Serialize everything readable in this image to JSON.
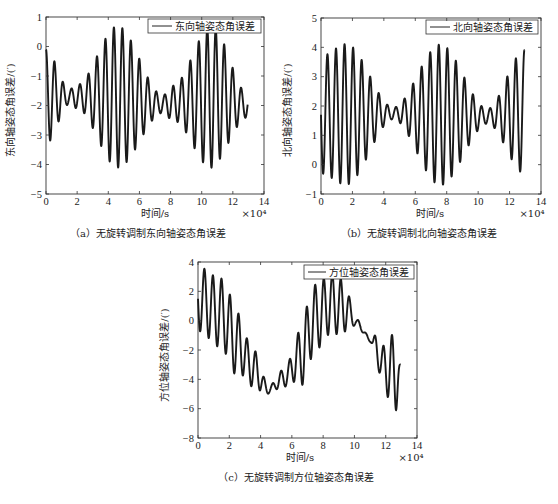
{
  "chart_data": [
    {
      "id": "a",
      "type": "line",
      "caption": "（a）无旋转调制东向轴姿态角误差",
      "xlabel": "时间/s",
      "xscale_label": "×10⁴",
      "ylabel": "东向轴姿态角误差/(′)",
      "legend": "东向轴姿态角误差",
      "xlim": [
        0,
        14
      ],
      "ylim": [
        -5,
        1
      ],
      "xticks": [
        0,
        2,
        4,
        6,
        8,
        10,
        12,
        14
      ],
      "yticks": [
        -5,
        -4,
        -3,
        -2,
        -1,
        0,
        1
      ],
      "grid": false,
      "frame": {
        "x0": 46,
        "y0": 17,
        "x1": 264,
        "y1": 194
      },
      "legend_box": {
        "x": 148,
        "y": 19,
        "w": 113,
        "h": 14
      },
      "signal": {
        "x_end": 12.95,
        "period": 0.545,
        "phase": 0.0,
        "center": [
          [
            0,
            -1.7
          ],
          [
            4.5,
            -1.7
          ],
          [
            7.5,
            -1.95
          ],
          [
            11,
            -1.7
          ],
          [
            12.95,
            -2.0
          ]
        ],
        "amplitude": [
          [
            0,
            1.6
          ],
          [
            1.5,
            0.25
          ],
          [
            2.0,
            0.4
          ],
          [
            4.6,
            2.4
          ],
          [
            7.5,
            0.3
          ],
          [
            8.2,
            0.6
          ],
          [
            10.6,
            2.4
          ],
          [
            12.95,
            0.4
          ]
        ]
      }
    },
    {
      "id": "b",
      "type": "line",
      "caption": "（b）无旋转调制北向轴姿态角误差",
      "xlabel": "时间/s",
      "xscale_label": "×10⁴",
      "ylabel": "北向轴姿态角误差/(′)",
      "legend": "北向轴姿态角误差",
      "xlim": [
        0,
        14
      ],
      "ylim": [
        -1,
        5
      ],
      "xticks": [
        0,
        2,
        4,
        6,
        8,
        10,
        12,
        14
      ],
      "yticks": [
        -1,
        0,
        1,
        2,
        3,
        4,
        5
      ],
      "grid": false,
      "frame": {
        "x0": 321,
        "y0": 18,
        "x1": 541,
        "y1": 194
      },
      "legend_box": {
        "x": 426,
        "y": 20,
        "w": 112,
        "h": 14
      },
      "signal": {
        "x_end": 12.95,
        "period": 0.545,
        "phase": 0.25,
        "center": [
          [
            0,
            1.7
          ],
          [
            4.5,
            1.75
          ],
          [
            7.5,
            1.7
          ],
          [
            10.5,
            1.65
          ],
          [
            12.95,
            1.8
          ]
        ],
        "amplitude": [
          [
            0,
            2.0
          ],
          [
            1.6,
            2.4
          ],
          [
            4.6,
            0.2
          ],
          [
            7.6,
            2.4
          ],
          [
            10.6,
            0.25
          ],
          [
            12.95,
            2.1
          ]
        ]
      }
    },
    {
      "id": "c",
      "type": "line",
      "caption": "（c）无旋转调制方位轴姿态角误差",
      "xlabel": "时间/s",
      "xscale_label": "×10⁴",
      "ylabel": "方位轴姿态角误差/(′)",
      "legend": "方位轴姿态角误差",
      "xlim": [
        0,
        14
      ],
      "ylim": [
        -8,
        4
      ],
      "xticks": [
        0,
        2,
        4,
        6,
        8,
        10,
        12,
        14
      ],
      "yticks": [
        -8,
        -6,
        -4,
        -2,
        0,
        2,
        4
      ],
      "grid": false,
      "frame": {
        "x0": 198,
        "y0": 262,
        "x1": 417,
        "y1": 438
      },
      "legend_box": {
        "x": 304,
        "y": 265,
        "w": 110,
        "h": 14
      },
      "signal": {
        "x_end": 12.95,
        "period": 0.545,
        "phase": 0.25,
        "center": [
          [
            0,
            1.5
          ],
          [
            1.5,
            0.5
          ],
          [
            2.5,
            -1.5
          ],
          [
            3.5,
            -3.2
          ],
          [
            4.5,
            -4.7
          ],
          [
            5.5,
            -3.9
          ],
          [
            6.5,
            -2.5
          ],
          [
            7.5,
            0.2
          ],
          [
            8.5,
            1.2
          ],
          [
            9.5,
            0.8
          ],
          [
            10.2,
            -0.2
          ],
          [
            11.0,
            -1.3
          ],
          [
            12.0,
            -3.2
          ],
          [
            12.95,
            -3.8
          ]
        ],
        "amplitude": [
          [
            0,
            2.2
          ],
          [
            2.0,
            2.4
          ],
          [
            3.5,
            1.3
          ],
          [
            4.6,
            0.25
          ],
          [
            5.5,
            0.6
          ],
          [
            7.0,
            2.3
          ],
          [
            9.0,
            2.0
          ],
          [
            10.2,
            0.25
          ],
          [
            11.0,
            0.15
          ],
          [
            11.5,
            1.0
          ],
          [
            12.6,
            2.6
          ],
          [
            12.95,
            0.8
          ]
        ]
      }
    }
  ],
  "figure_caption_partial": ""
}
